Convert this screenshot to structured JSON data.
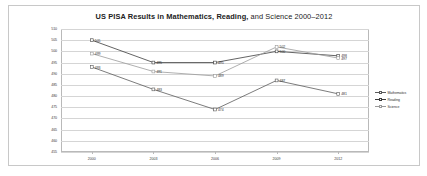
{
  "chart_data": {
    "type": "line",
    "title": "US PISA Results in Mathematics, Reading, and Science 2000–2012",
    "title_bold_part": "US PISA Results in Mathematics, Reading,",
    "title_normal_part": " and Science 2000–2012",
    "xlabel": "",
    "ylabel": "",
    "categories": [
      "2000",
      "2003",
      "2006",
      "2009",
      "2012"
    ],
    "ylim": [
      455,
      510
    ],
    "yticks": [
      510,
      505,
      500,
      495,
      490,
      485,
      480,
      475,
      470,
      465,
      460,
      455
    ],
    "grid": true,
    "legend_position": "right",
    "series": [
      {
        "name": "Mathematics",
        "color": "#5a5a5a",
        "values": [
          493,
          483,
          474,
          487,
          481
        ],
        "labels": [
          "493",
          "483",
          "474",
          "487",
          "481"
        ]
      },
      {
        "name": "Reading",
        "color": "#3c3c3c",
        "values": [
          505,
          495,
          495,
          500,
          498
        ],
        "labels": [
          "505",
          "495",
          "495",
          "500",
          "498"
        ]
      },
      {
        "name": "Science",
        "color": "#9a9a9a",
        "values": [
          499,
          491,
          489,
          502,
          497
        ],
        "labels": [
          "499",
          "491",
          "489",
          "502",
          "497"
        ]
      }
    ]
  }
}
